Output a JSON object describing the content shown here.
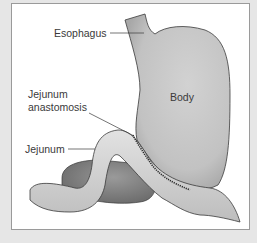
{
  "figure": {
    "type": "anatomical-diagram",
    "labels": {
      "esophagus": "Esophagus",
      "body": "Body",
      "jejunum_anastomosis_line1": "Jejunum",
      "jejunum_anastomosis_line2": "anastomosis",
      "jejunum": "Jejunum"
    },
    "colors": {
      "background": "#e6e6e6",
      "frame_fill": "#ffffff",
      "frame_border": "#9a9a9a",
      "stomach_fill": "#c8c8c8",
      "jejunum_fill": "#d6d6d6",
      "dark_pouch": "#8a8a8a",
      "outline": "#3a3a3a",
      "suture": "#2a2a2a"
    }
  }
}
